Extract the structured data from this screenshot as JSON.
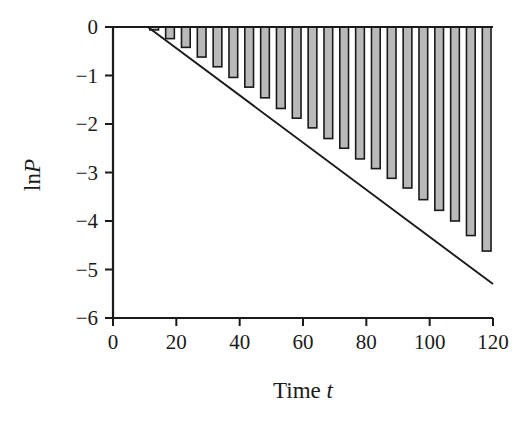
{
  "chart_data": {
    "type": "bar",
    "title": "",
    "subtitle": "",
    "xlabel": "Time t",
    "xlabel_plain": "Time",
    "xlabel_italic": "t",
    "ylabel": "lnP",
    "ylabel_plain": "ln",
    "ylabel_italic": "P",
    "xlim": [
      0,
      120
    ],
    "ylim": [
      -6,
      0
    ],
    "xticks": [
      0,
      20,
      40,
      60,
      80,
      100,
      120
    ],
    "xtick_labels": [
      "0",
      "20",
      "40",
      "60",
      "80",
      "100",
      "120"
    ],
    "yticks": [
      0,
      -1,
      -2,
      -3,
      -4,
      -5,
      -6
    ],
    "ytick_labels": [
      "0",
      "-1",
      "-2",
      "-3",
      "-4",
      "-5",
      "-6"
    ],
    "grid": false,
    "legend": null,
    "bar_fill_color": "#b9b9b9",
    "bar_edge_color": "#1a1a1a",
    "line_color": "#1a1a1a",
    "axis_color": "#1a1a1a",
    "background_color": "#ffffff",
    "x": [
      13,
      18,
      23,
      28,
      33,
      38,
      43,
      48,
      53,
      58,
      63,
      68,
      73,
      78,
      83,
      88,
      93,
      98,
      103,
      108,
      113,
      118
    ],
    "values": [
      -0.06,
      -0.24,
      -0.42,
      -0.62,
      -0.82,
      -1.04,
      -1.24,
      -1.46,
      -1.68,
      -1.88,
      -2.08,
      -2.3,
      -2.5,
      -2.72,
      -2.92,
      -3.12,
      -3.32,
      -3.56,
      -3.78,
      -4.0,
      -4.3,
      -4.62
    ],
    "categories": [
      "13",
      "18",
      "23",
      "28",
      "33",
      "38",
      "43",
      "48",
      "53",
      "58",
      "63",
      "68",
      "73",
      "78",
      "83",
      "88",
      "93",
      "98",
      "103",
      "108",
      "113",
      "118"
    ],
    "series": [
      {
        "name": "lnP bars",
        "type": "bar",
        "values": [
          -0.06,
          -0.24,
          -0.42,
          -0.62,
          -0.82,
          -1.04,
          -1.24,
          -1.46,
          -1.68,
          -1.88,
          -2.08,
          -2.3,
          -2.5,
          -2.72,
          -2.92,
          -3.12,
          -3.32,
          -3.56,
          -3.78,
          -4.0,
          -4.3,
          -4.62
        ]
      },
      {
        "name": "fitted decay line",
        "type": "line",
        "x": [
          11,
          120
        ],
        "y": [
          0,
          -5.3
        ],
        "slope": -0.0444,
        "intercept": 0.0
      }
    ],
    "annotations": []
  },
  "figure": {
    "plot_left_px": 113,
    "plot_right_px": 493,
    "plot_top_px": 27,
    "plot_bottom_px": 318
  }
}
